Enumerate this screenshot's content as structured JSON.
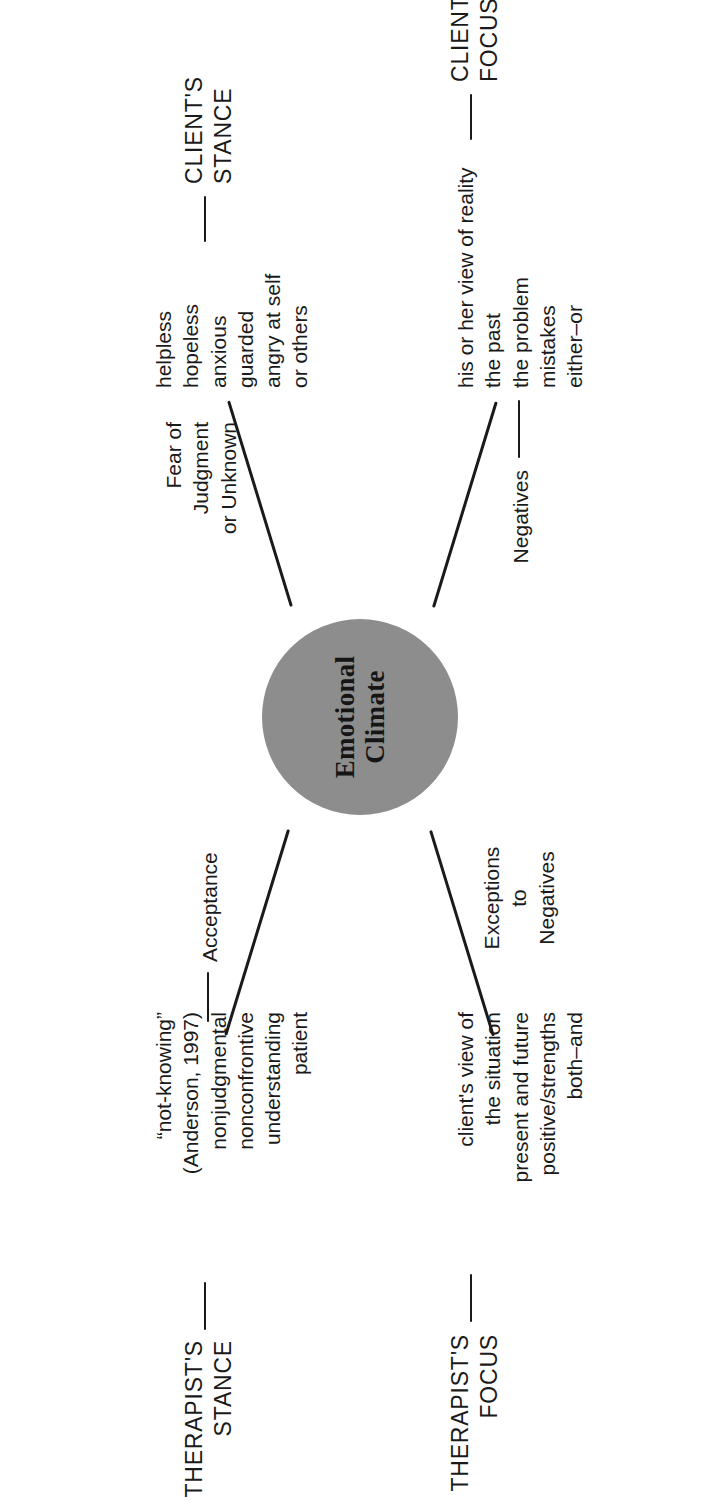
{
  "figure": {
    "type": "radial-spoke-diagram",
    "orientation": "rotated-90-ccw",
    "hub": {
      "line1": "Emotional",
      "line2": "Climate",
      "fill": "#8d8d8d"
    },
    "ink_color": "#1a1a1a",
    "background": "#ffffff"
  },
  "quadrants": {
    "client_stance": {
      "caption_line1": "CLIENT'S",
      "caption_line2": "STANCE",
      "link_label_line1": "Fear of",
      "link_label_line2": "Judgment",
      "link_label_line3": "or Unknown",
      "items": [
        "helpless",
        "hopeless",
        "anxious",
        "guarded",
        "angry at self",
        "or others"
      ]
    },
    "client_focus": {
      "caption_line1": "CLIENT'S",
      "caption_line2": "FOCUS",
      "link_label": "Negatives",
      "items": [
        "his or her view of reality",
        "the past",
        "the problem",
        "mistakes",
        "either–or"
      ]
    },
    "therapist_stance": {
      "caption_line1": "THERAPIST'S",
      "caption_line2": "STANCE",
      "link_label": "Acceptance",
      "items": [
        "“not-knowing”",
        "(Anderson, 1997)",
        "nonjudgmental",
        "nonconfrontive",
        "understanding",
        "patient"
      ]
    },
    "therapist_focus": {
      "caption_line1": "THERAPIST'S",
      "caption_line2": "FOCUS",
      "link_label_line1": "Exceptions",
      "link_label_line2": "to",
      "link_label_line3": "Negatives",
      "items": [
        "client's view of",
        "the situation",
        "present and future",
        "positive/strengths",
        "both–and"
      ]
    }
  }
}
